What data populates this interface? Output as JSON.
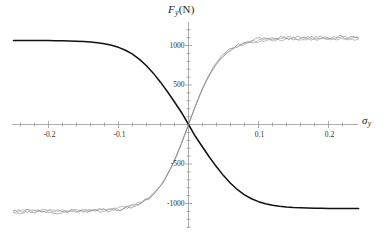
{
  "chart_data": {
    "type": "line",
    "title": "",
    "subtitle": "",
    "xlabel": "sigma_y",
    "ylabel": "F_y(N)",
    "xlabel_display": {
      "symbol": "σ",
      "sub": "y"
    },
    "ylabel_display": {
      "symbol": "F",
      "sub": "y",
      "unit": "(N)"
    },
    "grid": false,
    "legend": "none",
    "axis_style": "crossed-at-origin",
    "xlim": [
      -0.25,
      0.243
    ],
    "ylim": [
      -1280,
      1280
    ],
    "x_major_ticks": [
      -0.2,
      -0.1,
      0.1,
      0.2
    ],
    "x_major_tick_labels": [
      "-0.2",
      "-0.1",
      "0.1",
      "0.2"
    ],
    "x_minor_tick_step": 0.02,
    "y_major_ticks": [
      1000,
      500,
      -500,
      -1000
    ],
    "y_major_tick_labels": [
      "1000",
      "500",
      "-500",
      "-1000"
    ],
    "y_minor_tick_step": 100,
    "series": [
      {
        "name": "smooth-fit",
        "style": "solid-thick",
        "color": "#111111",
        "model": "tanh",
        "amplitude": 1065,
        "scale": 0.0455,
        "x": [
          -0.25,
          -0.24,
          -0.23,
          -0.22,
          -0.21,
          -0.2,
          -0.19,
          -0.18,
          -0.17,
          -0.16,
          -0.15,
          -0.14,
          -0.13,
          -0.12,
          -0.11,
          -0.1,
          -0.09,
          -0.08,
          -0.07,
          -0.06,
          -0.05,
          -0.04,
          -0.03,
          -0.02,
          -0.01,
          0.0,
          0.01,
          0.02,
          0.03,
          0.04,
          0.05,
          0.06,
          0.07,
          0.08,
          0.09,
          0.1,
          0.11,
          0.12,
          0.13,
          0.14,
          0.15,
          0.16,
          0.17,
          0.18,
          0.19,
          0.2,
          0.21,
          0.22,
          0.23,
          0.243
        ],
        "values": [
          1064,
          1064,
          1064,
          1063,
          1063,
          1062,
          1061,
          1060,
          1058,
          1055,
          1051,
          1045,
          1036,
          1023,
          1004,
          977,
          940,
          890,
          825,
          744,
          647,
          536,
          414,
          285,
          152,
          0,
          -152,
          -285,
          -414,
          -536,
          -647,
          -744,
          -825,
          -890,
          -940,
          -977,
          -1004,
          -1023,
          -1036,
          -1045,
          -1051,
          -1055,
          -1058,
          -1060,
          -1061,
          -1062,
          -1063,
          -1063,
          -1064,
          -1064
        ]
      },
      {
        "name": "experimental-trace-1",
        "style": "solid-thin-noisy",
        "color": "#6a6a6a",
        "noise_amplitude": 28,
        "plateau_high": 1105,
        "plateau_low": -1105
      },
      {
        "name": "experimental-trace-2",
        "style": "solid-thin-noisy",
        "color": "#7a7a7a",
        "noise_amplitude": 24,
        "plateau_high": 1090,
        "plateau_low": -1095
      },
      {
        "name": "experimental-trace-3",
        "style": "solid-thin-noisy",
        "color": "#8a8a8a",
        "noise_amplitude": 20,
        "plateau_high": 1078,
        "plateau_low": -1082
      }
    ]
  },
  "axes": {
    "y_axis_name": "y-axis",
    "x_axis_name": "x-axis",
    "origin_label": "0"
  },
  "colors": {
    "background": "#ffffff",
    "axis": "#7f7f7f",
    "fit_curve": "#111111",
    "data_curve": "#6f6f6f",
    "text": "#1c1c1c"
  }
}
